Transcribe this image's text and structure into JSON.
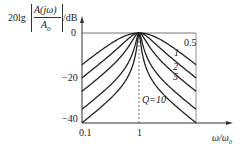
{
  "chart_data": {
    "type": "line",
    "title": "",
    "ylabel": "20lg |A(jω)/A0| /dB",
    "ylabel_parts": {
      "prefix": "20lg",
      "numerator": "A(jω)",
      "denominator": "A0",
      "unit": "/dB"
    },
    "xlabel": "ω/ω0",
    "x_scale": "log",
    "xlim": [
      0.1,
      10
    ],
    "ylim": [
      -40,
      0
    ],
    "x_ticks": [
      "0.1",
      "1"
    ],
    "y_ticks": [
      "0",
      "-20",
      "-40"
    ],
    "grid": false,
    "annotations": [
      "Q=10",
      "0.5",
      "1",
      "2",
      "5"
    ],
    "x": [
      0.1,
      0.2,
      0.5,
      1,
      2,
      5,
      10
    ],
    "series": [
      {
        "name": "Q=0.5",
        "values": [
          -15.1,
          -9.8,
          -3.4,
          0,
          -3.4,
          -9.8,
          -15.1
        ]
      },
      {
        "name": "Q=1",
        "values": [
          -20.0,
          -14.3,
          -6.4,
          0,
          -6.4,
          -14.3,
          -20.0
        ]
      },
      {
        "name": "Q=2",
        "values": [
          -25.1,
          -19.7,
          -10.8,
          0,
          -10.8,
          -19.7,
          -25.1
        ]
      },
      {
        "name": "Q=5",
        "values": [
          -33.0,
          -27.6,
          -18.2,
          0,
          -18.2,
          -27.6,
          -33.0
        ]
      },
      {
        "name": "Q=10",
        "values": [
          -39.9,
          -33.6,
          -24.1,
          0,
          -24.1,
          -33.6,
          -39.9
        ]
      }
    ]
  },
  "labels": {
    "y_prefix": "20lg",
    "y_num": "A(jω)",
    "y_den": "A",
    "y_den_sub": "0",
    "y_unit": "/dB",
    "tick_0": "0",
    "tick_m20": "−20",
    "tick_m40": "−40",
    "tick_x01": "0.1",
    "tick_x1": "1",
    "x_label": "ω/ω",
    "x_label_sub": "0",
    "q05": "0.5",
    "q1": "1",
    "q2": "2",
    "q5": "5",
    "q10": "Q=10"
  }
}
